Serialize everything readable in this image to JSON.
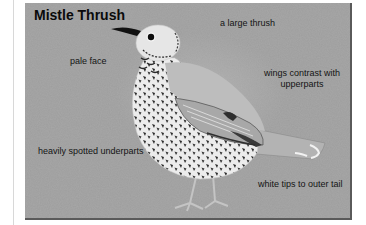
{
  "card": {
    "title": "Mistle Thrush",
    "panel_color": "#9d9d9d",
    "edge_color": "#5a5a5a",
    "labels": {
      "size": "a large thrush",
      "face": "pale face",
      "wings_line1": "wings contrast with",
      "wings_line2": "upperparts",
      "underparts": "heavily spotted underparts",
      "tail": "white tips to outer tail"
    },
    "illustration": {
      "subject": "mistle-thrush-bird",
      "facing": "left",
      "palette": "grayscale"
    }
  }
}
